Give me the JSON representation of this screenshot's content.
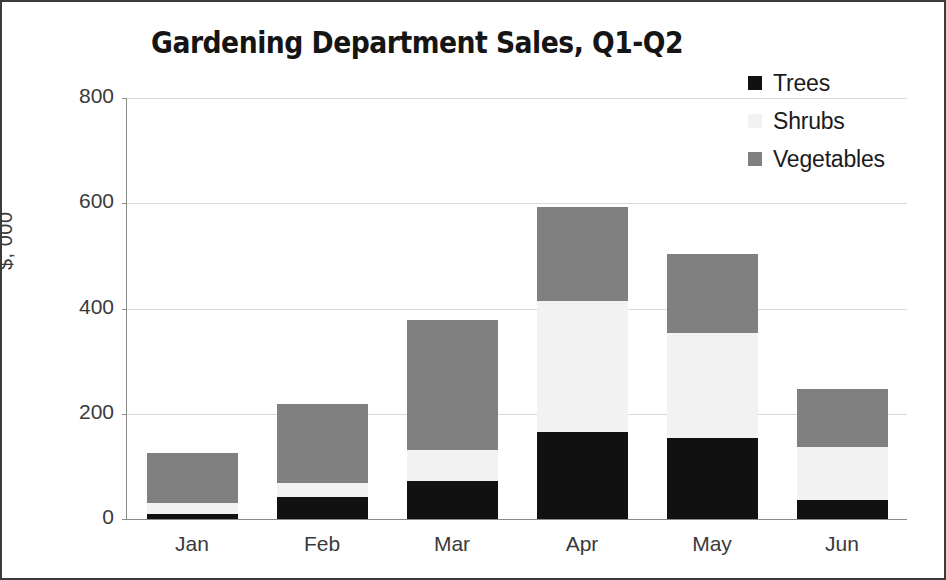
{
  "chart_data": {
    "type": "bar",
    "subtype": "stacked-column",
    "title": "Gardening Department Sales, Q1-Q2",
    "xlabel": "",
    "ylabel": "$, 000",
    "categories": [
      "Jan",
      "Feb",
      "Mar",
      "Apr",
      "May",
      "Jun"
    ],
    "series": [
      {
        "name": "Trees",
        "color": "#111111",
        "values": [
          10,
          42,
          72,
          165,
          153,
          37
        ]
      },
      {
        "name": "Shrubs",
        "color": "#f2f2f2",
        "values": [
          20,
          26,
          60,
          250,
          200,
          99
        ]
      },
      {
        "name": "Vegetables",
        "color": "#808080",
        "values": [
          95,
          150,
          246,
          178,
          150,
          111
        ]
      }
    ],
    "totals": [
      125,
      218,
      378,
      593,
      503,
      247
    ],
    "ylim": [
      0,
      800
    ],
    "yticks": [
      0,
      200,
      400,
      600,
      800
    ],
    "ytick_labels": [
      "0",
      "200",
      "400",
      "600",
      "800"
    ],
    "grid": "horizontal",
    "legend_position": "top-right",
    "background": "#ffffff",
    "border_color": "#3c3c3c"
  },
  "legend": {
    "items": [
      {
        "label": "Trees",
        "swatch": "#111111"
      },
      {
        "label": "Shrubs",
        "swatch": "#f2f2f2"
      },
      {
        "label": "Vegetables",
        "swatch": "#808080"
      }
    ]
  }
}
